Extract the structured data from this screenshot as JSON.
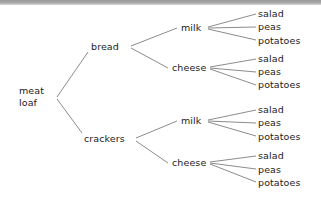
{
  "diagram": {
    "type": "tree",
    "orientation": "left-to-right",
    "line_color": "#8c8c8c",
    "text_color": "#1b1b1b",
    "background": "#ffffff",
    "root": {
      "label_line1": "meat",
      "label_line2": "loaf",
      "x": 19,
      "y": 85
    },
    "level1": [
      {
        "label": "bread",
        "x": 91,
        "y": 41
      },
      {
        "label": "crackers",
        "x": 84,
        "y": 133
      }
    ],
    "level2": [
      {
        "label": "milk",
        "x": 181,
        "y": 22,
        "parent": "bread"
      },
      {
        "label": "cheese",
        "x": 172,
        "y": 62,
        "parent": "bread"
      },
      {
        "label": "milk",
        "x": 181,
        "y": 115,
        "parent": "crackers"
      },
      {
        "label": "cheese",
        "x": 172,
        "y": 157,
        "parent": "crackers"
      }
    ],
    "leaf_groups": [
      {
        "parent": "bread-milk",
        "items": [
          {
            "label": "salad",
            "x": 258,
            "y": 8
          },
          {
            "label": "peas",
            "x": 258,
            "y": 21
          },
          {
            "label": "potatoes",
            "x": 258,
            "y": 35
          }
        ]
      },
      {
        "parent": "bread-cheese",
        "items": [
          {
            "label": "salad",
            "x": 258,
            "y": 53
          },
          {
            "label": "peas",
            "x": 258,
            "y": 66
          },
          {
            "label": "potatoes",
            "x": 258,
            "y": 79
          }
        ]
      },
      {
        "parent": "crackers-milk",
        "items": [
          {
            "label": "salad",
            "x": 258,
            "y": 104
          },
          {
            "label": "peas",
            "x": 258,
            "y": 117
          },
          {
            "label": "potatoes",
            "x": 258,
            "y": 131
          }
        ]
      },
      {
        "parent": "crackers-cheese",
        "items": [
          {
            "label": "salad",
            "x": 258,
            "y": 150
          },
          {
            "label": "peas",
            "x": 258,
            "y": 164
          },
          {
            "label": "potatoes",
            "x": 258,
            "y": 177
          }
        ]
      }
    ],
    "edges": [
      {
        "name": "root-to-bread",
        "x1": 57,
        "y1": 97,
        "x2": 88,
        "y2": 52
      },
      {
        "name": "root-to-crackers",
        "x1": 57,
        "y1": 99,
        "x2": 82,
        "y2": 133
      },
      {
        "name": "bread-to-milk",
        "x1": 131,
        "y1": 46,
        "x2": 177,
        "y2": 28
      },
      {
        "name": "bread-to-cheese",
        "x1": 131,
        "y1": 48,
        "x2": 168,
        "y2": 68
      },
      {
        "name": "crackers-to-milk",
        "x1": 136,
        "y1": 138,
        "x2": 177,
        "y2": 121
      },
      {
        "name": "crackers-to-cheese",
        "x1": 136,
        "y1": 141,
        "x2": 168,
        "y2": 163
      },
      {
        "name": "milk1-to-salad",
        "x1": 208,
        "y1": 27,
        "x2": 256,
        "y2": 14
      },
      {
        "name": "milk1-to-peas",
        "x1": 208,
        "y1": 28,
        "x2": 256,
        "y2": 27
      },
      {
        "name": "milk1-to-potatoes",
        "x1": 208,
        "y1": 29,
        "x2": 256,
        "y2": 40
      },
      {
        "name": "cheese1-to-salad",
        "x1": 210,
        "y1": 67,
        "x2": 256,
        "y2": 59
      },
      {
        "name": "cheese1-to-peas",
        "x1": 210,
        "y1": 68,
        "x2": 256,
        "y2": 72
      },
      {
        "name": "cheese1-to-potatoes",
        "x1": 210,
        "y1": 69,
        "x2": 256,
        "y2": 85
      },
      {
        "name": "milk2-to-salad",
        "x1": 208,
        "y1": 120,
        "x2": 256,
        "y2": 110
      },
      {
        "name": "milk2-to-peas",
        "x1": 208,
        "y1": 121,
        "x2": 256,
        "y2": 123
      },
      {
        "name": "milk2-to-potatoes",
        "x1": 208,
        "y1": 122,
        "x2": 256,
        "y2": 136
      },
      {
        "name": "cheese2-to-salad",
        "x1": 210,
        "y1": 162,
        "x2": 256,
        "y2": 156
      },
      {
        "name": "cheese2-to-peas",
        "x1": 210,
        "y1": 163,
        "x2": 256,
        "y2": 169
      },
      {
        "name": "cheese2-to-potatoes",
        "x1": 210,
        "y1": 164,
        "x2": 256,
        "y2": 182
      }
    ]
  }
}
